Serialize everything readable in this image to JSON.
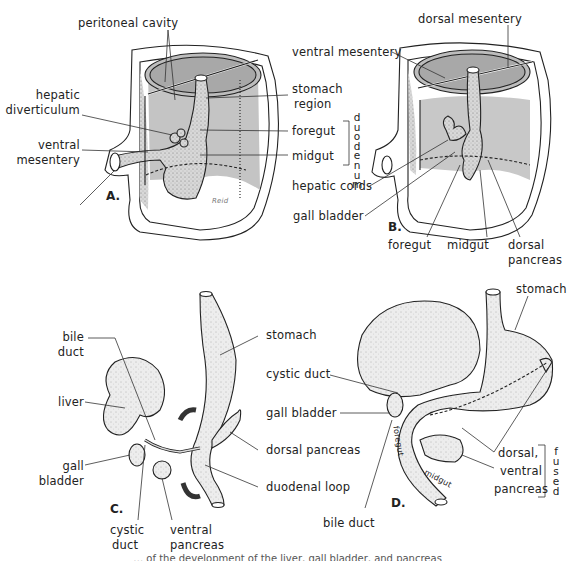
{
  "figure": {
    "panels": [
      {
        "id": "A",
        "label": "A.",
        "callouts": {
          "peritoneal_cavity": "peritoneal cavity",
          "hepatic_diverticulum_1": "hepatic",
          "hepatic_diverticulum_2": "diverticulum",
          "ventral_mesentery_1": "ventral",
          "ventral_mesentery_2": "mesentery",
          "stomach_region_1": "stomach",
          "stomach_region_2": "region",
          "foregut": "foregut",
          "midgut": "midgut",
          "duodenum_vertical": "duodenum"
        },
        "signature": "Reid"
      },
      {
        "id": "B",
        "label": "B.",
        "callouts": {
          "dorsal_mesentery": "dorsal mesentery",
          "ventral_mesentery": "ventral mesentery",
          "hepatic_cords": "hepatic cords",
          "gall_bladder": "gall bladder",
          "foregut": "foregut",
          "midgut": "midgut",
          "dorsal_pancreas_1": "dorsal",
          "dorsal_pancreas_2": "pancreas"
        }
      },
      {
        "id": "C",
        "label": "C.",
        "callouts": {
          "bile_duct_1": "bile",
          "bile_duct_2": "duct",
          "liver": "liver",
          "gall_bladder_1": "gall",
          "gall_bladder_2": "bladder",
          "cystic_duct_1": "cystic",
          "cystic_duct_2": "duct",
          "ventral_pancreas_1": "ventral",
          "ventral_pancreas_2": "pancreas",
          "stomach": "stomach",
          "dorsal_pancreas": "dorsal pancreas",
          "duodenal_loop": "duodenal loop"
        }
      },
      {
        "id": "D",
        "label": "D.",
        "callouts": {
          "stomach": "stomach",
          "cystic_duct": "cystic duct",
          "gall_bladder": "gall bladder",
          "bile_duct": "bile duct",
          "dorsal_ventral_pancreas_1": "dorsal,",
          "dorsal_ventral_pancreas_2": "ventral",
          "dorsal_ventral_pancreas_3": "pancreas",
          "fused_vertical": "fused",
          "foregut_inline": "foregut",
          "midgut_inline": "midgut"
        }
      }
    ],
    "caption_partial": "… of the development of the liver, gall bladder, and pancreas"
  },
  "colors": {
    "ink": "#222222",
    "shade": "#c8c8c8",
    "shade_dark": "#9a9a9a",
    "paper": "#ffffff"
  }
}
